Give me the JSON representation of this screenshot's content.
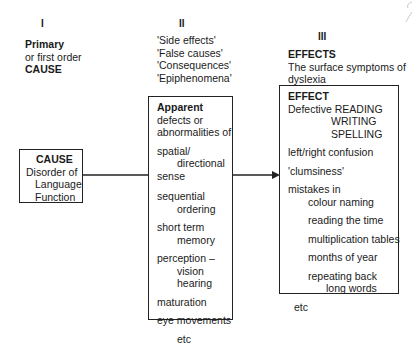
{
  "columns": [
    {
      "numeral": "I",
      "heading_bold": "Primary",
      "lines": [
        "or first order"
      ],
      "tail_bold": "CAUSE"
    },
    {
      "numeral": "II",
      "lines": [
        "'Side effects'",
        "'False causes'",
        "'Consequences'",
        "'Epiphenomena'"
      ]
    },
    {
      "numeral": "III",
      "heading_bold": "EFFECTS",
      "lines": [
        "The surface symptoms of",
        "dyslexia"
      ]
    }
  ],
  "cause_box": {
    "title": "CAUSE",
    "lines": [
      "Disorder of",
      "Language",
      "Function"
    ]
  },
  "apparent_box": {
    "title": "Apparent",
    "intro": [
      "defects or",
      "abnormalities of"
    ],
    "items": [
      {
        "lines": [
          "spatial/",
          "directional",
          "sense"
        ]
      },
      {
        "lines": [
          "sequential",
          "ordering"
        ]
      },
      {
        "lines": [
          "short term",
          "memory"
        ]
      },
      {
        "lines": [
          "perception –",
          "vision",
          "hearing"
        ]
      },
      {
        "lines": [
          "maturation"
        ]
      },
      {
        "lines": [
          "eye movements"
        ]
      },
      {
        "lines": [
          "etc"
        ]
      }
    ]
  },
  "effect_box": {
    "title": "EFFECT",
    "defective_label": "Defective",
    "defective_items": [
      "READING",
      "WRITING",
      "SPELLING"
    ],
    "items": [
      "left/right confusion",
      "'clumsiness'"
    ],
    "mistakes_label": "mistakes in",
    "mistakes": [
      "colour naming",
      "reading the time",
      "multiplication tables",
      "months of year",
      "repeating back",
      "long words"
    ],
    "etc": "etc"
  }
}
